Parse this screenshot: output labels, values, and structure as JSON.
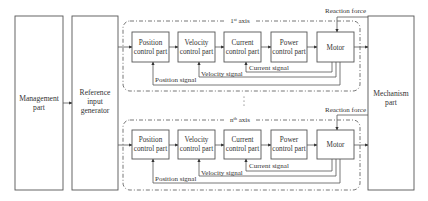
{
  "diagram": {
    "blocks": {
      "management": [
        "Management",
        "part"
      ],
      "reference": [
        "Reference",
        "input",
        "generator"
      ],
      "mechanism": [
        "Mechanism",
        "part"
      ]
    },
    "axes": [
      {
        "label": "1st axis",
        "label_main": "1",
        "label_sup": "st",
        "label_rest": " axis",
        "blocks": [
          {
            "id": "position",
            "lines": [
              "Position",
              "control part"
            ]
          },
          {
            "id": "velocity",
            "lines": [
              "Velocity",
              "control part"
            ]
          },
          {
            "id": "current",
            "lines": [
              "Current",
              "control part"
            ]
          },
          {
            "id": "power",
            "lines": [
              "Power",
              "control part"
            ]
          },
          {
            "id": "motor",
            "lines": [
              "Motor"
            ]
          }
        ],
        "signals": {
          "position": "Position signal",
          "velocity": "Velocity signal",
          "current": "Current signal"
        },
        "reaction_force": "Reaction force"
      },
      {
        "label": "nth axis",
        "label_main": "n",
        "label_sup": "th",
        "label_rest": " axis",
        "blocks": [
          {
            "id": "position",
            "lines": [
              "Position",
              "control part"
            ]
          },
          {
            "id": "velocity",
            "lines": [
              "Velocity",
              "control part"
            ]
          },
          {
            "id": "current",
            "lines": [
              "Current",
              "control part"
            ]
          },
          {
            "id": "power",
            "lines": [
              "Power",
              "control part"
            ]
          },
          {
            "id": "motor",
            "lines": [
              "Motor"
            ]
          }
        ],
        "signals": {
          "position": "Position signal",
          "velocity": "Velocity signal",
          "current": "Current signal"
        },
        "reaction_force": "Reaction force"
      }
    ],
    "ellipsis": "⋮"
  }
}
